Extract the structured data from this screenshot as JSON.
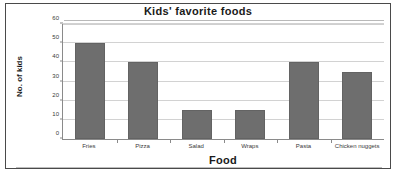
{
  "chart_data": {
    "type": "bar",
    "title": "Kids' favorite foods",
    "xlabel": "Food",
    "ylabel": "No. of kids",
    "categories": [
      "Fries",
      "Pizza",
      "Salad",
      "Wraps",
      "Pasta",
      "Chicken nuggets"
    ],
    "values": [
      50,
      40,
      15,
      15,
      40,
      35
    ],
    "ylim": [
      0,
      60
    ],
    "yticks": [
      0,
      10,
      20,
      30,
      40,
      50,
      60
    ],
    "ytick_labels": [
      "0",
      "10",
      "20",
      "30",
      "40",
      "50",
      "60"
    ],
    "grid": true,
    "legend": false,
    "legend_position": "none",
    "bar_color": "#6e6e6e",
    "gridline_color": "#d2d2d2",
    "axis_color": "#8a8a8a",
    "background_color": "#ffffff",
    "border_color": "#4a4a4a"
  }
}
